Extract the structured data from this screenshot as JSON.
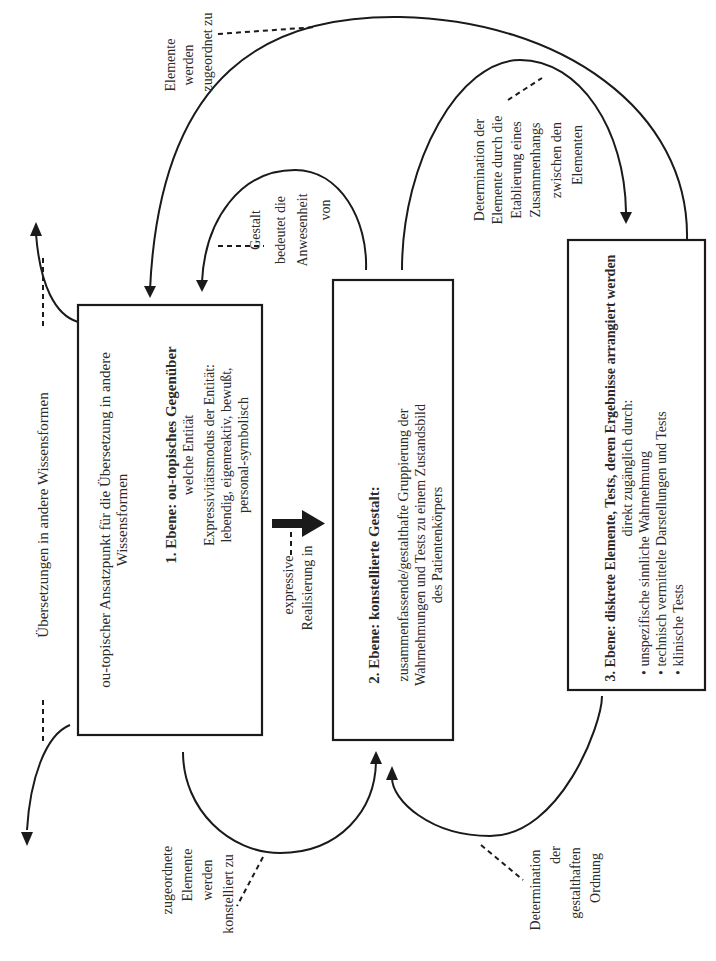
{
  "diagram": {
    "colors": {
      "line": "#1a1a1a",
      "text": "#2a2a2a",
      "background": "#ffffff"
    },
    "box1": {
      "intro_line1": "ou-topischer Ansatzpunkt für die Übersetzung in andere",
      "intro_line2": "Wissensformen",
      "heading": "1. Ebene: ou-topisches Gegenüber",
      "subheading": "welche Entität",
      "detail_line1": "Expressivitätsmodus der Entität:",
      "detail_line2": "lebendig, eigenreaktiv, bewußt,",
      "detail_line3": "personal-symbolisch"
    },
    "box2": {
      "heading": "2. Ebene: konstellierte Gestalt:",
      "body_line1": "zusammenfassende/gestalthafte Gruppierung der",
      "body_line2": "Wahrnehmungen und Tests zu einem Zustandsbild",
      "body_line3": "des Patientenkörpers"
    },
    "box3": {
      "heading": "3. Ebene: diskrete Elemente, Tests, deren Ergebnisse arrangiert werden",
      "subheading": "direkt zugänglich durch:",
      "bullets": [
        "• unspezifische sinnliche Wahrnehmung",
        "• technisch vermittelte Darstellungen und Tests",
        "• klinische Tests"
      ]
    },
    "annotations": {
      "translations": "Übersetzungen in andere Wissensformen",
      "assigned": [
        "Elemente",
        "werden",
        "zugeordnet zu"
      ],
      "gestalt_presence": [
        "Gestalt",
        "bedeutet die",
        "Anwesenheit",
        "von"
      ],
      "determination_elements": [
        "Determination der",
        "Elemente durch die",
        "Etablierung eines",
        "Zusammenhangs",
        "zwischen den",
        "Elementen"
      ],
      "expressive": [
        "expressive",
        "Realisierung in"
      ],
      "constellated": [
        "zugeordnete",
        "Elemente",
        "werden",
        "konstelliert zu"
      ],
      "determination_order": [
        "Determination",
        "der",
        "gestalthaften",
        "Ordnung"
      ]
    }
  }
}
